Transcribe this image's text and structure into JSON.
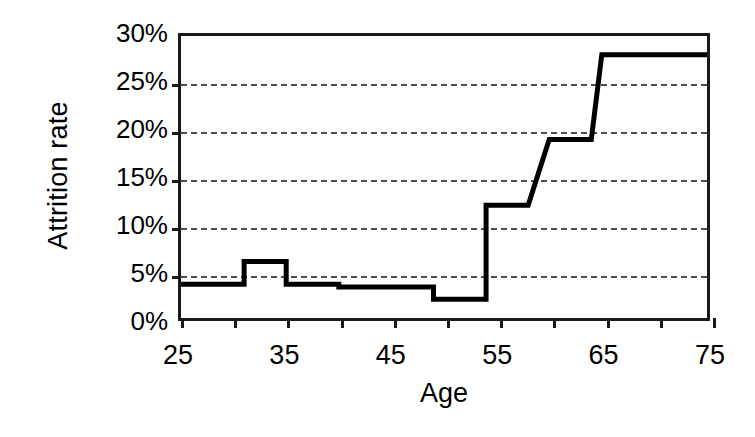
{
  "chart_data": {
    "type": "line",
    "title": "",
    "subtitle": "",
    "xlabel": "Age",
    "ylabel": "Attrition rate",
    "xlim": [
      25,
      75
    ],
    "ylim": [
      0,
      30
    ],
    "grid": "horizontal-dashed",
    "legend": "none",
    "step_style": "post",
    "x_ticks": [
      25,
      30,
      35,
      40,
      45,
      50,
      55,
      60,
      65,
      70,
      75
    ],
    "x_tick_labels": [
      "25",
      "",
      "35",
      "",
      "45",
      "",
      "55",
      "",
      "65",
      "",
      "75"
    ],
    "y_ticks": [
      0,
      5,
      10,
      15,
      20,
      25,
      30
    ],
    "y_tick_labels": [
      "0%",
      "5%",
      "10%",
      "15%",
      "20%",
      "25%",
      "30%"
    ],
    "gridline_values": [
      5,
      10,
      15,
      20,
      25
    ],
    "series": [
      {
        "name": "Attrition rate",
        "color": "#000000",
        "x": [
          25,
          31,
          31,
          35,
          35,
          40,
          40,
          49,
          49,
          50,
          50,
          54,
          54,
          58,
          58,
          60,
          60,
          64,
          64,
          65,
          65,
          75
        ],
        "y": [
          3.6,
          3.6,
          6.0,
          6.0,
          3.6,
          3.6,
          3.3,
          3.3,
          2.0,
          2.0,
          2.0,
          2.0,
          12.0,
          12.0,
          12.0,
          19.0,
          19.0,
          19.0,
          19.0,
          28.0,
          28.0,
          28.0
        ],
        "points": [
          {
            "age": 25,
            "rate": 3.6
          },
          {
            "age": 31,
            "rate": 6.0
          },
          {
            "age": 35,
            "rate": 3.6
          },
          {
            "age": 40,
            "rate": 3.3
          },
          {
            "age": 49,
            "rate": 2.0
          },
          {
            "age": 54,
            "rate": 12.0
          },
          {
            "age": 60,
            "rate": 19.0
          },
          {
            "age": 65,
            "rate": 28.0
          },
          {
            "age": 75,
            "rate": 28.0
          }
        ]
      }
    ]
  },
  "axes": {
    "y_labels": [
      {
        "text": "30%",
        "value": 30
      },
      {
        "text": "25%",
        "value": 25
      },
      {
        "text": "20%",
        "value": 20
      },
      {
        "text": "15%",
        "value": 15
      },
      {
        "text": "10%",
        "value": 10
      },
      {
        "text": "5%",
        "value": 5
      },
      {
        "text": "0%",
        "value": 0
      }
    ],
    "x_labels": [
      {
        "text": "25",
        "value": 25
      },
      {
        "text": "35",
        "value": 35
      },
      {
        "text": "45",
        "value": 45
      },
      {
        "text": "55",
        "value": 55
      },
      {
        "text": "65",
        "value": 65
      },
      {
        "text": "75",
        "value": 75
      }
    ],
    "x_title": "Age",
    "y_title": "Attrition rate"
  },
  "colors": {
    "line": "#000000",
    "axis": "#1a1a1a",
    "grid": "#4d4d4d",
    "background": "#ffffff"
  }
}
